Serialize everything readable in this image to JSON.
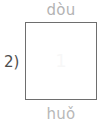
{
  "item": {
    "number_label": "2)",
    "top_pinyin": "dòu",
    "bottom_pinyin": "huǒ",
    "box_content": "",
    "watermark_mark": "1"
  },
  "colors": {
    "page_background": "#ffffff",
    "box_border": "#6e6e6e",
    "box_fill": "#ffffff",
    "pinyin_top_text": "#b3b3b3",
    "pinyin_bottom_text": "#b8b8b8",
    "item_number_text": "#4d4d4d"
  }
}
